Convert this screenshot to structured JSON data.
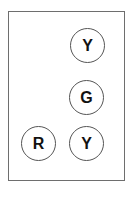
{
  "frame": {
    "border_color": "#6e6e6e"
  },
  "tokens": [
    {
      "label": "Y",
      "cx": 88,
      "cy": 46
    },
    {
      "label": "G",
      "cx": 87,
      "cy": 98
    },
    {
      "label": "R",
      "cx": 39,
      "cy": 144
    },
    {
      "label": "Y",
      "cx": 87,
      "cy": 144
    }
  ]
}
